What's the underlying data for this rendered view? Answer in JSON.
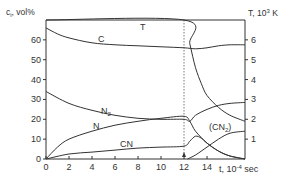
{
  "chart_data": {
    "type": "line",
    "title": "",
    "xlabel": "t, 10⁻⁴ sec",
    "ylabel_left": "c_i, vol%",
    "ylabel_right": "T, 10³ K",
    "xlim": [
      0,
      17.3
    ],
    "ylim_left": [
      0,
      70
    ],
    "ylim_right": [
      0,
      7
    ],
    "x_ticks": [
      0,
      2,
      4,
      6,
      8,
      10,
      12,
      14
    ],
    "y_left_ticks": [
      0,
      10,
      20,
      30,
      40,
      50,
      60
    ],
    "y_right_ticks": [
      1,
      2,
      3,
      4,
      5,
      6
    ],
    "grid": false,
    "vline": {
      "x": 12,
      "style": "dotted"
    },
    "series": [
      {
        "name": "C",
        "axis": "left",
        "points": [
          [
            0,
            66
          ],
          [
            1,
            63
          ],
          [
            2,
            61
          ],
          [
            4,
            58.5
          ],
          [
            6,
            57.5
          ],
          [
            8,
            57
          ],
          [
            10,
            56.5
          ],
          [
            12,
            56
          ],
          [
            13,
            55.5
          ],
          [
            14,
            56
          ],
          [
            15,
            57
          ],
          [
            16,
            57.5
          ],
          [
            17.3,
            57.5
          ]
        ]
      },
      {
        "name": "T",
        "axis": "right",
        "points": [
          [
            0,
            7
          ],
          [
            12,
            7
          ],
          [
            12.5,
            5.8
          ],
          [
            13,
            4.6
          ],
          [
            13.5,
            3.8
          ],
          [
            14,
            3.2
          ],
          [
            15,
            2.6
          ],
          [
            16,
            2.2
          ],
          [
            17.3,
            1.9
          ]
        ]
      },
      {
        "name": "N2",
        "axis": "left",
        "points": [
          [
            0,
            34
          ],
          [
            2,
            28
          ],
          [
            4,
            24.5
          ],
          [
            6,
            22
          ],
          [
            8,
            20.5
          ],
          [
            10,
            20
          ],
          [
            12,
            20
          ],
          [
            12.5,
            19
          ],
          [
            13,
            22
          ],
          [
            14,
            25
          ],
          [
            15,
            27
          ],
          [
            16,
            28
          ],
          [
            17.3,
            28.5
          ]
        ]
      },
      {
        "name": "N",
        "axis": "left",
        "points": [
          [
            0,
            0
          ],
          [
            1,
            6
          ],
          [
            2,
            10
          ],
          [
            4,
            14
          ],
          [
            6,
            17
          ],
          [
            8,
            19
          ],
          [
            10,
            20.5
          ],
          [
            12,
            21.5
          ],
          [
            12.5,
            19
          ],
          [
            13,
            14
          ],
          [
            14,
            8
          ],
          [
            15,
            4
          ],
          [
            16,
            1.5
          ],
          [
            17.3,
            0
          ]
        ]
      },
      {
        "name": "CN",
        "axis": "left",
        "points": [
          [
            0,
            0
          ],
          [
            2,
            2.5
          ],
          [
            4,
            3.5
          ],
          [
            6,
            4.5
          ],
          [
            8,
            5.5
          ],
          [
            10,
            6
          ],
          [
            12,
            6.5
          ],
          [
            12.5,
            9
          ],
          [
            13,
            11.5
          ],
          [
            13.5,
            10.5
          ],
          [
            14,
            8
          ],
          [
            15,
            4
          ],
          [
            16,
            1.5
          ],
          [
            17.3,
            0
          ]
        ]
      },
      {
        "name": "(CN2)",
        "axis": "left",
        "points": [
          [
            12.3,
            0
          ],
          [
            13,
            2
          ],
          [
            14,
            6
          ],
          [
            15,
            10
          ],
          [
            16,
            13
          ],
          [
            17.3,
            14
          ]
        ]
      }
    ],
    "annotations": [
      "T",
      "C",
      "N2",
      "N",
      "CN",
      "(CN2)"
    ]
  },
  "labels": {
    "y_left": "c",
    "y_left_sub": "i",
    "y_left_rest": ", vol%",
    "y_right": "T, 10",
    "y_right_sup": "3",
    "y_right_rest": " K",
    "x_axis": "t, 10",
    "x_axis_sup": "-4",
    "x_axis_rest": " sec",
    "curve_T": "T",
    "curve_C": "C",
    "curve_N2": "N",
    "curve_N2_sub": "2",
    "curve_N": "N",
    "curve_CN": "CN",
    "curve_CN2_open": "(CN",
    "curve_CN2_sub": "2",
    "curve_CN2_close": ")"
  },
  "ticks": {
    "x": [
      "0",
      "2",
      "4",
      "6",
      "8",
      "10",
      "12",
      "14"
    ],
    "y_left": [
      "0",
      "10",
      "20",
      "30",
      "40",
      "50",
      "60"
    ],
    "y_right": [
      "1",
      "2",
      "3",
      "4",
      "5",
      "6"
    ]
  },
  "colors": {
    "line": "#333333",
    "axis": "#333333",
    "text": "#333333"
  }
}
